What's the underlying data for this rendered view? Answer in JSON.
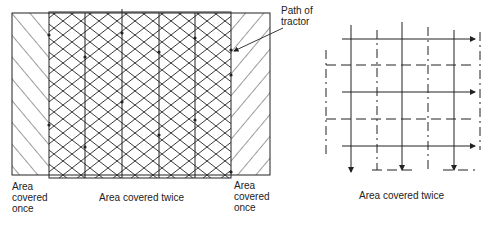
{
  "left_figure": {
    "labels": {
      "left_once": [
        "Area",
        "covered",
        "once"
      ],
      "middle_twice": "Area covered twice",
      "right_once": [
        "Area",
        "covered",
        "once"
      ],
      "path_of_tractor": [
        "Path of",
        "tractor"
      ]
    }
  },
  "right_figure": {
    "caption": "Area covered twice"
  },
  "colors": {
    "line": "#222222",
    "background": "#ffffff"
  }
}
